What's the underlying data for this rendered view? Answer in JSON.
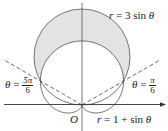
{
  "diagram": {
    "type": "polar-curves",
    "curves": [
      {
        "name": "circle",
        "equation_lhs": "r",
        "equation_eq": " = ",
        "equation_rhs": "3 sin ",
        "var": "θ"
      },
      {
        "name": "cardioid",
        "equation_lhs": "r",
        "equation_eq": " = ",
        "equation_rhs": "1 + sin ",
        "var": "θ"
      }
    ],
    "origin_label": "O",
    "angle_labels": [
      {
        "var": "θ",
        "eq": " = ",
        "num": "5π",
        "den": "6"
      },
      {
        "var": "θ",
        "eq": " = ",
        "num": "π",
        "den": "6"
      }
    ],
    "shaded_region": "inside r = 3 sin θ and outside r = 1 + sin θ",
    "colors": {
      "shade": "#e3e3e3",
      "stroke": "#555555",
      "axis": "#333333"
    }
  }
}
